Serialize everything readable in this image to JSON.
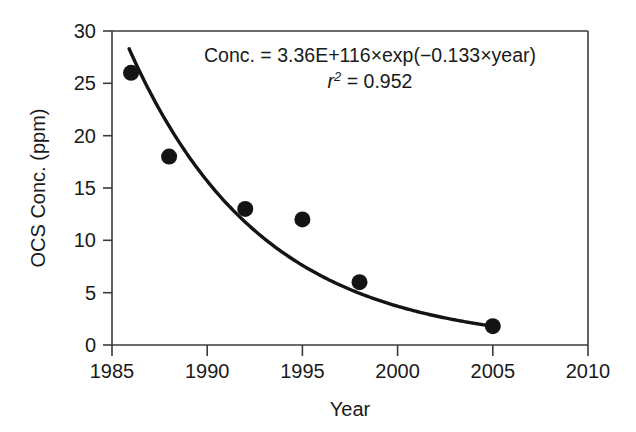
{
  "chart_data": {
    "type": "scatter",
    "title": "",
    "xlabel": "Year",
    "ylabel": "OCS Conc. (ppm)",
    "xlim": [
      1985,
      2010
    ],
    "ylim": [
      0,
      30
    ],
    "xticks": [
      1985,
      1990,
      1995,
      2000,
      2005,
      2010
    ],
    "xticklabels": [
      "1985",
      "1990",
      "1995",
      "2000",
      "2005",
      "2010"
    ],
    "yticks": [
      0,
      5,
      10,
      15,
      20,
      25,
      30
    ],
    "yticklabels": [
      "0",
      "5",
      "10",
      "15",
      "20",
      "25",
      "30"
    ],
    "grid": false,
    "legend": null,
    "x": [
      1986,
      1988,
      1992,
      1995,
      1998,
      2005
    ],
    "values": [
      26,
      18,
      13,
      12,
      6,
      1.8
    ],
    "series": [
      {
        "name": "OCS concentration measurements",
        "marker": "filled-circle",
        "color": "#141414",
        "points": [
          {
            "x": 1986,
            "y": 26
          },
          {
            "x": 1988,
            "y": 18
          },
          {
            "x": 1992,
            "y": 13
          },
          {
            "x": 1995,
            "y": 12
          },
          {
            "x": 1998,
            "y": 6
          },
          {
            "x": 2005,
            "y": 1.8
          }
        ]
      },
      {
        "name": "Exponential fit",
        "marker": "line",
        "color": "#141414",
        "fit": {
          "model": "exponential-decay",
          "amplitude": "3.36E+116",
          "rate": -0.133,
          "variable": "year",
          "x_start": 1985.9,
          "x_end": 2005.0
        }
      }
    ],
    "annotations": [
      {
        "name": "fit-equation",
        "line1_prefix": "Conc. = 3.36E+116",
        "line1_times1": "×",
        "line1_mid": "exp(−0.133",
        "line1_times2": "×",
        "line1_suffix": "year)",
        "line2_r": "r",
        "line2_sup": "2",
        "line2_rest": " = 0.952"
      }
    ]
  },
  "axes": {
    "x_title": "Year",
    "y_title": "OCS Conc. (ppm)"
  }
}
